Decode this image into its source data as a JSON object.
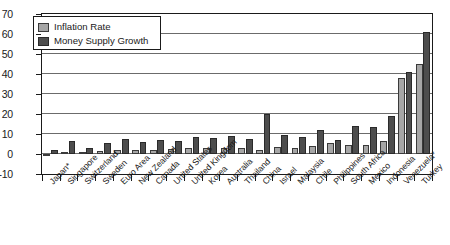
{
  "chart_data": {
    "type": "bar",
    "title": "",
    "xlabel": "",
    "ylabel": "",
    "ylim": [
      -10,
      70
    ],
    "ytick_labels": [
      "70",
      "60",
      "50",
      "40",
      "30",
      "20",
      "10",
      "0",
      "-10"
    ],
    "ytick_values": [
      70,
      60,
      50,
      40,
      30,
      20,
      10,
      0,
      -10
    ],
    "grid": true,
    "legend_position": "top-left",
    "categories": [
      "Japan*",
      "Singapore",
      "Switzerland",
      "Sweden",
      "Euro Area",
      "New Zealand",
      "Canada",
      "United States",
      "United Kingdom",
      "Korea",
      "Australia",
      "Thailand",
      "China",
      "Israel",
      "Malaysia",
      "Chile",
      "Philippines",
      "South Africa",
      "Mexico",
      "Indonesia",
      "Venezuela*",
      "Turkey"
    ],
    "series": [
      {
        "name": "Inflation Rate",
        "color": "#a6a6a6",
        "values": [
          -0.9,
          0.5,
          0.8,
          1.3,
          2.1,
          1.8,
          2.2,
          2.5,
          2.9,
          3.1,
          3.0,
          3.2,
          1.8,
          3.5,
          3.2,
          3.8,
          5.5,
          4.5,
          4.7,
          6.4,
          38.0,
          45.0
        ]
      },
      {
        "name": "Money Supply Growth",
        "color": "#4d4d4d",
        "values": [
          2.0,
          6.5,
          3.0,
          5.5,
          7.5,
          6.0,
          7.0,
          6.5,
          8.5,
          8.0,
          9.0,
          7.5,
          20.0,
          9.5,
          8.5,
          12.0,
          7.0,
          14.0,
          13.5,
          19.0,
          41.0,
          61.0
        ]
      }
    ]
  },
  "legend": {
    "items": [
      {
        "label": "Inflation Rate"
      },
      {
        "label": "Money Supply Growth"
      }
    ]
  }
}
